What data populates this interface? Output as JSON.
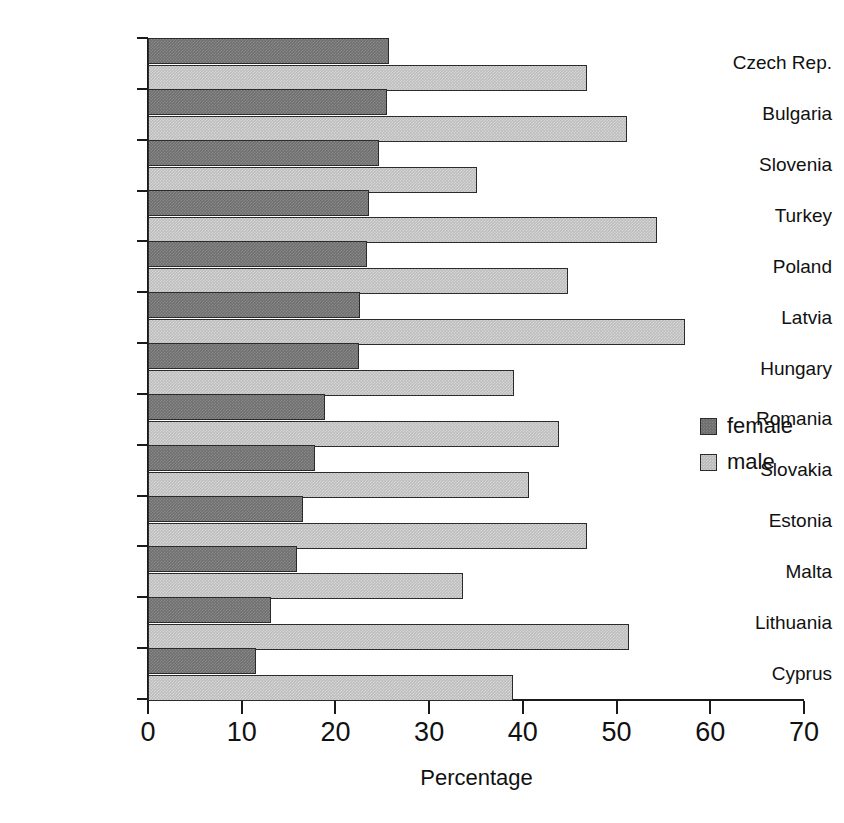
{
  "chart_data": {
    "type": "bar",
    "orientation": "horizontal",
    "title": "",
    "xlabel": "Percentage",
    "ylabel": "",
    "xlim": [
      0,
      70
    ],
    "xticks": [
      0,
      10,
      20,
      30,
      40,
      50,
      60,
      70
    ],
    "xtick_labels": [
      "0",
      "10",
      "20",
      "30",
      "40",
      "50",
      "60",
      "70"
    ],
    "grid": false,
    "legend_position": "right-middle",
    "categories": [
      "Czech Rep.",
      "Bulgaria",
      "Slovenia",
      "Turkey",
      "Poland",
      "Latvia",
      "Hungary",
      "Romania",
      "Slovakia",
      "Estonia",
      "Malta",
      "Lithuania",
      "Cyprus"
    ],
    "series": [
      {
        "name": "female",
        "color": "#6f6f6f",
        "values": [
          25.7,
          25.5,
          24.7,
          23.6,
          23.4,
          22.6,
          22.5,
          18.9,
          17.8,
          16.5,
          15.9,
          13.1,
          11.5
        ]
      },
      {
        "name": "male",
        "color": "#bdbdbd",
        "values": [
          46.8,
          51.1,
          35.1,
          54.3,
          44.8,
          57.3,
          39.1,
          43.9,
          40.7,
          46.8,
          33.6,
          51.3,
          38.9
        ]
      }
    ]
  },
  "legend": {
    "items": [
      {
        "label": "female",
        "key": "female"
      },
      {
        "label": "male",
        "key": "male"
      }
    ]
  },
  "axis": {
    "x_title": "Percentage"
  },
  "caption": {
    "remnant": ""
  }
}
